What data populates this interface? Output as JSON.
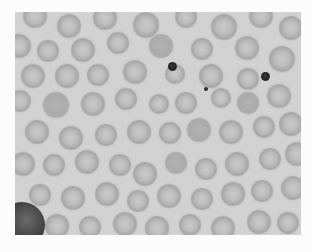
{
  "figure": {
    "caption": "",
    "caption_note": "Caption text at the bottom edge is cropped and not legible",
    "colors": {
      "background": "#d2d2d2",
      "cell_ring": "#a9a9a9",
      "cell_center": "#c9c9c9",
      "dark_dot": "#222222",
      "page": "#fcfcfc"
    }
  },
  "cells": [
    {
      "x": 8,
      "y": -8,
      "d": 24
    },
    {
      "x": 42,
      "y": 2,
      "d": 24
    },
    {
      "x": 78,
      "y": -6,
      "d": 24
    },
    {
      "x": 118,
      "y": 0,
      "d": 26
    },
    {
      "x": 160,
      "y": -6,
      "d": 22
    },
    {
      "x": 196,
      "y": 2,
      "d": 26
    },
    {
      "x": 234,
      "y": -8,
      "d": 24
    },
    {
      "x": 264,
      "y": 4,
      "d": 24
    },
    {
      "x": -8,
      "y": 22,
      "d": 24
    },
    {
      "x": 22,
      "y": 28,
      "d": 22
    },
    {
      "x": 56,
      "y": 26,
      "d": 24
    },
    {
      "x": 92,
      "y": 20,
      "d": 22
    },
    {
      "x": 134,
      "y": 22,
      "d": 24,
      "solid": true
    },
    {
      "x": 176,
      "y": 26,
      "d": 22
    },
    {
      "x": 220,
      "y": 24,
      "d": 24
    },
    {
      "x": 254,
      "y": 34,
      "d": 26
    },
    {
      "x": 6,
      "y": 52,
      "d": 24
    },
    {
      "x": 40,
      "y": 52,
      "d": 24
    },
    {
      "x": 72,
      "y": 52,
      "d": 22
    },
    {
      "x": 108,
      "y": 48,
      "d": 24
    },
    {
      "x": 150,
      "y": 52,
      "d": 20
    },
    {
      "x": 184,
      "y": 52,
      "d": 24
    },
    {
      "x": 222,
      "y": 56,
      "d": 22
    },
    {
      "x": -6,
      "y": 78,
      "d": 22
    },
    {
      "x": 28,
      "y": 80,
      "d": 26,
      "solid": true
    },
    {
      "x": 66,
      "y": 80,
      "d": 24
    },
    {
      "x": 100,
      "y": 76,
      "d": 22
    },
    {
      "x": 134,
      "y": 82,
      "d": 20
    },
    {
      "x": 160,
      "y": 80,
      "d": 22
    },
    {
      "x": 196,
      "y": 76,
      "d": 20
    },
    {
      "x": 222,
      "y": 80,
      "d": 22,
      "solid": true
    },
    {
      "x": 252,
      "y": 72,
      "d": 24
    },
    {
      "x": 10,
      "y": 108,
      "d": 24
    },
    {
      "x": 44,
      "y": 114,
      "d": 24
    },
    {
      "x": 80,
      "y": 112,
      "d": 22
    },
    {
      "x": 112,
      "y": 108,
      "d": 24
    },
    {
      "x": 144,
      "y": 110,
      "d": 22
    },
    {
      "x": 172,
      "y": 106,
      "d": 24,
      "solid": true
    },
    {
      "x": 204,
      "y": 108,
      "d": 24
    },
    {
      "x": 238,
      "y": 104,
      "d": 22
    },
    {
      "x": 264,
      "y": 100,
      "d": 24
    },
    {
      "x": -4,
      "y": 140,
      "d": 24
    },
    {
      "x": 28,
      "y": 142,
      "d": 22
    },
    {
      "x": 60,
      "y": 138,
      "d": 24
    },
    {
      "x": 94,
      "y": 142,
      "d": 22
    },
    {
      "x": 118,
      "y": 150,
      "d": 24
    },
    {
      "x": 150,
      "y": 140,
      "d": 22,
      "solid": true
    },
    {
      "x": 180,
      "y": 146,
      "d": 22
    },
    {
      "x": 210,
      "y": 140,
      "d": 24
    },
    {
      "x": 244,
      "y": 136,
      "d": 22
    },
    {
      "x": 270,
      "y": 130,
      "d": 24
    },
    {
      "x": 14,
      "y": 172,
      "d": 22
    },
    {
      "x": 46,
      "y": 174,
      "d": 24
    },
    {
      "x": 80,
      "y": 170,
      "d": 24
    },
    {
      "x": 112,
      "y": 178,
      "d": 22
    },
    {
      "x": 142,
      "y": 172,
      "d": 24
    },
    {
      "x": 176,
      "y": 176,
      "d": 22
    },
    {
      "x": 206,
      "y": 170,
      "d": 24
    },
    {
      "x": 236,
      "y": 168,
      "d": 22
    },
    {
      "x": 266,
      "y": 164,
      "d": 24
    },
    {
      "x": 30,
      "y": 202,
      "d": 24
    },
    {
      "x": 64,
      "y": 204,
      "d": 22
    },
    {
      "x": 98,
      "y": 200,
      "d": 24
    },
    {
      "x": 130,
      "y": 204,
      "d": 24
    },
    {
      "x": 164,
      "y": 202,
      "d": 22
    },
    {
      "x": 196,
      "y": 204,
      "d": 24
    },
    {
      "x": 232,
      "y": 198,
      "d": 24
    },
    {
      "x": 262,
      "y": 200,
      "d": 22
    }
  ],
  "dots": [
    {
      "x": 153,
      "y": 50,
      "d": 9
    },
    {
      "x": 246,
      "y": 60,
      "d": 9
    },
    {
      "x": 189,
      "y": 75,
      "d": 4
    }
  ],
  "large_cell": {
    "x": -16,
    "y": 190,
    "d": 46
  }
}
